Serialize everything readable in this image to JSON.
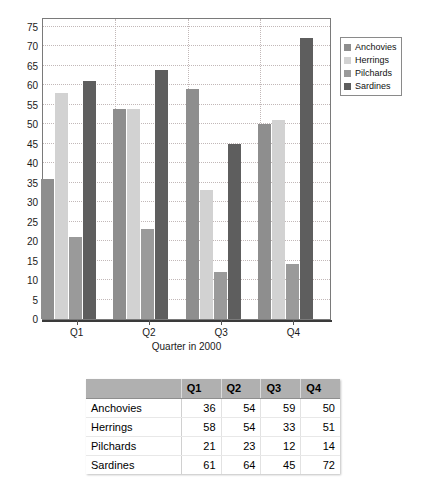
{
  "chart_data": {
    "type": "bar",
    "title": "",
    "subtitle": "",
    "xlabel": "Quarter in 2000",
    "ylabel": "",
    "categories": [
      "Q1",
      "Q2",
      "Q3",
      "Q4"
    ],
    "series": [
      {
        "name": "Anchovies",
        "values": [
          36,
          54,
          59,
          50
        ],
        "color": "#8e8e8e"
      },
      {
        "name": "Herrings",
        "values": [
          58,
          54,
          33,
          51
        ],
        "color": "#d2d2d2"
      },
      {
        "name": "Pilchards",
        "values": [
          21,
          23,
          12,
          14
        ],
        "color": "#9a9a9a"
      },
      {
        "name": "Sardines",
        "values": [
          61,
          64,
          45,
          72
        ],
        "color": "#5e5e5e"
      }
    ],
    "ylim": [
      0,
      77.5
    ],
    "yticks": [
      0,
      5,
      10,
      15,
      20,
      25,
      30,
      35,
      40,
      45,
      50,
      55,
      60,
      65,
      70,
      75
    ],
    "ytick_labels": [
      "0",
      "5",
      "10",
      "15",
      "20",
      "25",
      "30",
      "35",
      "40",
      "45",
      "50",
      "55",
      "60",
      "65",
      "70",
      "75"
    ],
    "grid": true,
    "legend_position": "right"
  },
  "legend": {
    "items": [
      {
        "label": "Anchovies",
        "color": "#8e8e8e"
      },
      {
        "label": "Herrings",
        "color": "#d2d2d2"
      },
      {
        "label": "Pilchards",
        "color": "#9a9a9a"
      },
      {
        "label": "Sardines",
        "color": "#5e5e5e"
      }
    ]
  },
  "table": {
    "corner_label": "",
    "columns": [
      "Q1",
      "Q2",
      "Q3",
      "Q4"
    ],
    "rows": [
      {
        "label": "Anchovies",
        "values": [
          "36",
          "54",
          "59",
          "50"
        ]
      },
      {
        "label": "Herrings",
        "values": [
          "58",
          "54",
          "33",
          "51"
        ]
      },
      {
        "label": "Pilchards",
        "values": [
          "21",
          "23",
          "12",
          "14"
        ]
      },
      {
        "label": "Sardines",
        "values": [
          "61",
          "64",
          "45",
          "72"
        ]
      }
    ]
  },
  "colors": {
    "grid": "#c2b8b8",
    "axis": "#3a3a3a",
    "frame": "#7a7a7a",
    "table_header_bg": "#b0b0b0"
  }
}
